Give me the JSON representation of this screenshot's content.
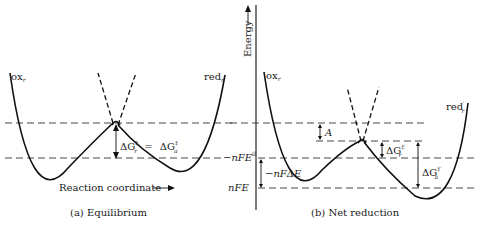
{
  "figure": {
    "panel_a": {
      "caption": "(a)  Equilibrium",
      "curve_left_label": "ox",
      "curve_left_sub": "r",
      "curve_right_label": "red",
      "curve_right_sub": "r",
      "barrier_label": "ΔG‡ = ΔG‡",
      "barrier_label_left": "ΔG",
      "barrier_label_left_sub": "r",
      "barrier_label_eq": "=",
      "barrier_label_right": "ΔG",
      "barrier_label_right_sub": "a",
      "double_dagger": "‡",
      "x_axis_label": "Reaction coordinate",
      "x_axis_arrow": "⟶"
    },
    "panel_b": {
      "caption": "(b)  Net reduction",
      "y_axis_label": "Energy",
      "curve_left_label": "ox",
      "curve_left_sub": "r",
      "curve_right_label": "red",
      "curve_right_sub": "r",
      "curve_right_prime": "′",
      "level_labels": {
        "nFE0": "−nFE",
        "nFE0_sup": "0",
        "nFE": "nFE",
        "delta": "−nFΔE"
      },
      "annotations": {
        "A": "A",
        "dGr": "ΔG",
        "dGr_sub": "r",
        "dGa": "ΔG",
        "dGa_sub": "a",
        "dagger_prime": "‡′"
      }
    }
  }
}
